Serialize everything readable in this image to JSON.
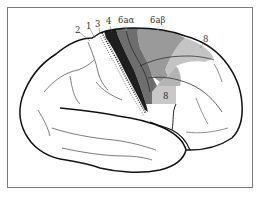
{
  "figure": {
    "type": "anatomical-diagram",
    "frame_color": "#7a7a7a"
  },
  "areas": [
    {
      "id": "area-2",
      "label": "2",
      "fill": "#ffffff"
    },
    {
      "id": "area-1",
      "label": "1",
      "fill": "#ffffff"
    },
    {
      "id": "area-3",
      "label": "3",
      "fill": "#ffffff"
    },
    {
      "id": "area-4",
      "label": "4",
      "fill": "#1e1e1e"
    },
    {
      "id": "area-6a-alpha",
      "label": "6aα",
      "fill": "#6e6e6e"
    },
    {
      "id": "area-6a-beta",
      "label": "6aβ",
      "fill": "#9a9a9a"
    },
    {
      "id": "area-8-upper",
      "label": "8",
      "fill": "#c4c4c4"
    },
    {
      "id": "area-8-lower",
      "label": "8",
      "fill": "#c8c8c8"
    }
  ],
  "colors": {
    "outline": "#111111",
    "sulcus": "#444444",
    "area_4": "#1e1e1e",
    "area_6a_alpha": "#6e6e6e",
    "area_6a_beta": "#9a9a9a",
    "area_8": "#c4c4c4",
    "background": "#ffffff"
  }
}
